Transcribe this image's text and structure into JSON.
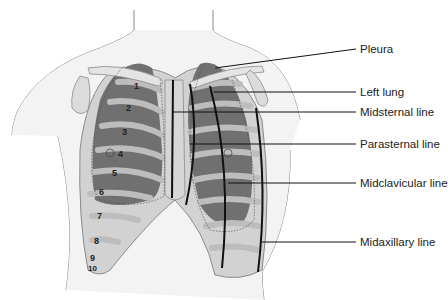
{
  "diagram": {
    "type": "anatomical-illustration",
    "labels": [
      {
        "id": "pleura",
        "text": "Pleura",
        "x": 360,
        "y": 42
      },
      {
        "id": "left-lung",
        "text": "Left lung",
        "x": 360,
        "y": 85
      },
      {
        "id": "midsternal-line",
        "text": "Midsternal line",
        "x": 360,
        "y": 105
      },
      {
        "id": "parasternal-line",
        "text": "Parasternal line",
        "x": 360,
        "y": 137
      },
      {
        "id": "midclavicular-line",
        "text": "Midclavicular line",
        "x": 360,
        "y": 176
      },
      {
        "id": "midaxillary-line",
        "text": "Midaxillary line",
        "x": 360,
        "y": 235
      }
    ],
    "rib_numbers": [
      {
        "text": "1",
        "x": 137,
        "y": 86
      },
      {
        "text": "2",
        "x": 129,
        "y": 108
      },
      {
        "text": "3",
        "x": 125,
        "y": 132
      },
      {
        "text": "4",
        "x": 121,
        "y": 154
      },
      {
        "text": "5",
        "x": 115,
        "y": 173
      },
      {
        "text": "6",
        "x": 102,
        "y": 192
      },
      {
        "text": "7",
        "x": 100,
        "y": 216
      },
      {
        "text": "8",
        "x": 97,
        "y": 241
      },
      {
        "text": "9",
        "x": 92,
        "y": 257
      },
      {
        "text": "10",
        "x": 93,
        "y": 268
      }
    ],
    "colors": {
      "skin": "#f2f2f2",
      "outline": "#8a8a8a",
      "lung_dark": "#6e6e6e",
      "rib_light": "#b8b8b8",
      "cartilage": "#d6d6d6",
      "reference_line": "#111111"
    }
  }
}
